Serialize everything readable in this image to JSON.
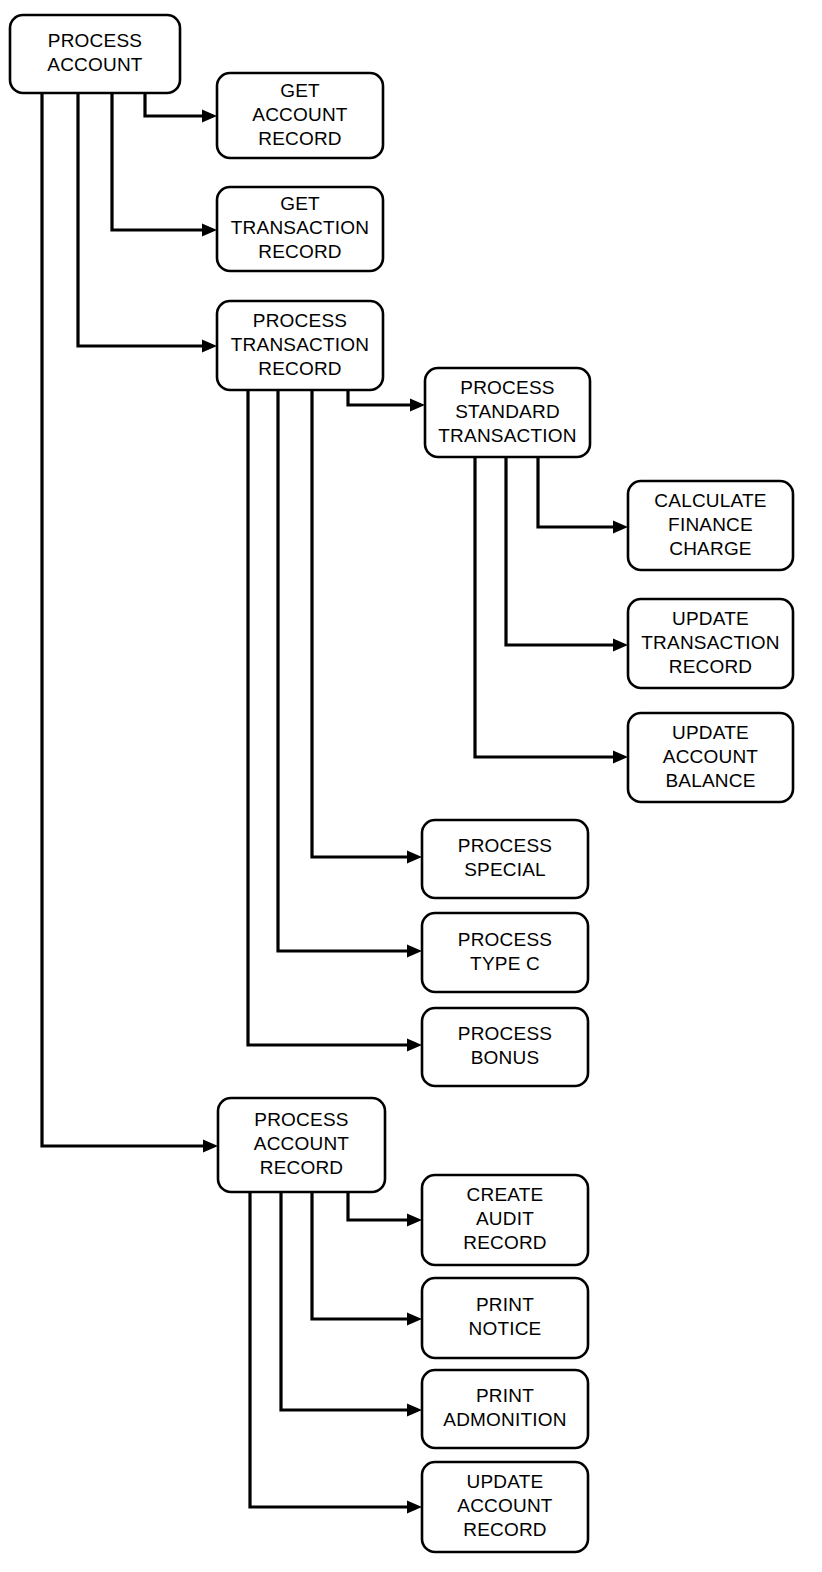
{
  "diagram": {
    "type": "structure-chart",
    "title": "",
    "background_color": "#ffffff",
    "line_color": "#000000",
    "box_fill": "#ffffff",
    "nodes": [
      {
        "id": "process-account",
        "lines": [
          "PROCESS",
          "ACCOUNT"
        ],
        "x": 10,
        "y": 15,
        "w": 170,
        "h": 78,
        "level": 0
      },
      {
        "id": "get-account-record",
        "lines": [
          "GET",
          "ACCOUNT",
          "RECORD"
        ],
        "x": 217,
        "y": 73,
        "w": 166,
        "h": 85,
        "level": 1
      },
      {
        "id": "get-transaction-record",
        "lines": [
          "GET",
          "TRANSACTION",
          "RECORD"
        ],
        "x": 217,
        "y": 187,
        "w": 166,
        "h": 84,
        "level": 1
      },
      {
        "id": "process-transaction-record",
        "lines": [
          "PROCESS",
          "TRANSACTION",
          "RECORD"
        ],
        "x": 217,
        "y": 301,
        "w": 166,
        "h": 89,
        "level": 1
      },
      {
        "id": "process-standard-transaction",
        "lines": [
          "PROCESS",
          "STANDARD",
          "TRANSACTION"
        ],
        "x": 425,
        "y": 368,
        "w": 165,
        "h": 89,
        "level": 2
      },
      {
        "id": "calculate-finance-charge",
        "lines": [
          "CALCULATE",
          "FINANCE",
          "CHARGE"
        ],
        "x": 628,
        "y": 481,
        "w": 165,
        "h": 89,
        "level": 3
      },
      {
        "id": "update-transaction-record",
        "lines": [
          "UPDATE",
          "TRANSACTION",
          "RECORD"
        ],
        "x": 628,
        "y": 599,
        "w": 165,
        "h": 89,
        "level": 3
      },
      {
        "id": "update-account-balance",
        "lines": [
          "UPDATE",
          "ACCOUNT",
          "BALANCE"
        ],
        "x": 628,
        "y": 713,
        "w": 165,
        "h": 89,
        "level": 3
      },
      {
        "id": "process-special",
        "lines": [
          "PROCESS",
          "SPECIAL"
        ],
        "x": 422,
        "y": 820,
        "w": 166,
        "h": 78,
        "level": 2
      },
      {
        "id": "process-type-c",
        "lines": [
          "PROCESS",
          "TYPE C"
        ],
        "x": 422,
        "y": 913,
        "w": 166,
        "h": 79,
        "level": 2
      },
      {
        "id": "process-bonus",
        "lines": [
          "PROCESS",
          "BONUS"
        ],
        "x": 422,
        "y": 1008,
        "w": 166,
        "h": 78,
        "level": 2
      },
      {
        "id": "process-account-record",
        "lines": [
          "PROCESS",
          "ACCOUNT",
          "RECORD"
        ],
        "x": 218,
        "y": 1098,
        "w": 167,
        "h": 94,
        "level": 1
      },
      {
        "id": "create-audit-record",
        "lines": [
          "CREATE",
          "AUDIT",
          "RECORD"
        ],
        "x": 422,
        "y": 1175,
        "w": 166,
        "h": 90,
        "level": 2
      },
      {
        "id": "print-notice",
        "lines": [
          "PRINT",
          "NOTICE"
        ],
        "x": 422,
        "y": 1278,
        "w": 166,
        "h": 80,
        "level": 2
      },
      {
        "id": "print-admonition",
        "lines": [
          "PRINT",
          "ADMONITION"
        ],
        "x": 422,
        "y": 1370,
        "w": 166,
        "h": 78,
        "level": 2
      },
      {
        "id": "update-account-record",
        "lines": [
          "UPDATE",
          "ACCOUNT",
          "RECORD"
        ],
        "x": 422,
        "y": 1462,
        "w": 166,
        "h": 90,
        "level": 2
      }
    ],
    "edges": [
      {
        "id": "edge-account-to-get-account-record",
        "from": "process-account",
        "to": "get-account-record",
        "stub_x": 145,
        "elbow_y": 116,
        "target_x": 217
      },
      {
        "id": "edge-account-to-get-transaction-record",
        "from": "process-account",
        "to": "get-transaction-record",
        "stub_x": 112,
        "elbow_y": 230,
        "target_x": 217
      },
      {
        "id": "edge-account-to-process-transaction-record",
        "from": "process-account",
        "to": "process-transaction-record",
        "stub_x": 78,
        "elbow_y": 346,
        "target_x": 217
      },
      {
        "id": "edge-account-to-process-account-record",
        "from": "process-account",
        "to": "process-account-record",
        "stub_x": 42,
        "elbow_y": 1146,
        "target_x": 218
      },
      {
        "id": "edge-transaction-to-standard",
        "from": "process-transaction-record",
        "to": "process-standard-transaction",
        "stub_x": 348,
        "elbow_y": 405,
        "target_x": 425
      },
      {
        "id": "edge-transaction-to-special",
        "from": "process-transaction-record",
        "to": "process-special",
        "stub_x": 312,
        "elbow_y": 857,
        "target_x": 422
      },
      {
        "id": "edge-transaction-to-type-c",
        "from": "process-transaction-record",
        "to": "process-type-c",
        "stub_x": 278,
        "elbow_y": 951,
        "target_x": 422
      },
      {
        "id": "edge-transaction-to-bonus",
        "from": "process-transaction-record",
        "to": "process-bonus",
        "stub_x": 248,
        "elbow_y": 1045,
        "target_x": 422
      },
      {
        "id": "edge-standard-to-finance-charge",
        "from": "process-standard-transaction",
        "to": "calculate-finance-charge",
        "stub_x": 538,
        "elbow_y": 527,
        "target_x": 628
      },
      {
        "id": "edge-standard-to-update-transaction",
        "from": "process-standard-transaction",
        "to": "update-transaction-record",
        "stub_x": 506,
        "elbow_y": 645,
        "target_x": 628
      },
      {
        "id": "edge-standard-to-update-balance",
        "from": "process-standard-transaction",
        "to": "update-account-balance",
        "stub_x": 475,
        "elbow_y": 757,
        "target_x": 628
      },
      {
        "id": "edge-account-record-to-create-audit",
        "from": "process-account-record",
        "to": "create-audit-record",
        "stub_x": 348,
        "elbow_y": 1220,
        "target_x": 422
      },
      {
        "id": "edge-account-record-to-print-notice",
        "from": "process-account-record",
        "to": "print-notice",
        "stub_x": 312,
        "elbow_y": 1319,
        "target_x": 422
      },
      {
        "id": "edge-account-record-to-print-admonition",
        "from": "process-account-record",
        "to": "print-admonition",
        "stub_x": 281,
        "elbow_y": 1410,
        "target_x": 422
      },
      {
        "id": "edge-account-record-to-update-account-record",
        "from": "process-account-record",
        "to": "update-account-record",
        "stub_x": 250,
        "elbow_y": 1507,
        "target_x": 422
      }
    ]
  }
}
